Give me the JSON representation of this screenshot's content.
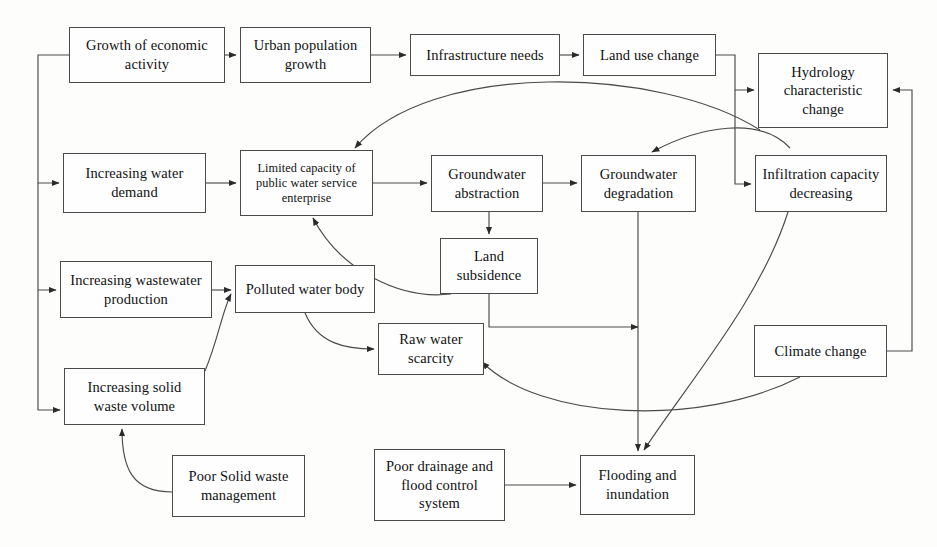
{
  "diagram": {
    "stroke_color": "#4a4a4a",
    "text_color": "#111111",
    "background": "#fdfdfc",
    "nodes": [
      {
        "id": "growth_economic",
        "label": "Growth of economic\nactivity",
        "x": 69,
        "y": 27,
        "w": 156,
        "h": 56,
        "small": false
      },
      {
        "id": "urban_population",
        "label": "Urban population\ngrowth",
        "x": 240,
        "y": 27,
        "w": 131,
        "h": 56,
        "small": false
      },
      {
        "id": "infrastructure_needs",
        "label": "Infrastructure needs",
        "x": 410,
        "y": 34,
        "w": 150,
        "h": 42,
        "small": false
      },
      {
        "id": "land_use_change",
        "label": "Land use change",
        "x": 583,
        "y": 34,
        "w": 133,
        "h": 42,
        "small": false
      },
      {
        "id": "hydrology_change",
        "label": "Hydrology\ncharacteristic\nchange",
        "x": 758,
        "y": 53,
        "w": 130,
        "h": 75,
        "small": false
      },
      {
        "id": "increasing_water_demand",
        "label": "Increasing water\ndemand",
        "x": 63,
        "y": 153,
        "w": 143,
        "h": 60,
        "small": false
      },
      {
        "id": "limited_capacity",
        "label": "Limited capacity of\npublic water service\nenterprise",
        "x": 240,
        "y": 150,
        "w": 133,
        "h": 66,
        "small": true
      },
      {
        "id": "groundwater_abstraction",
        "label": "Groundwater\nabstraction",
        "x": 431,
        "y": 155,
        "w": 112,
        "h": 57,
        "small": false
      },
      {
        "id": "groundwater_degradation",
        "label": "Groundwater\ndegradation",
        "x": 581,
        "y": 155,
        "w": 115,
        "h": 57,
        "small": false
      },
      {
        "id": "infiltration_decreasing",
        "label": "Infiltration capacity\ndecreasing",
        "x": 755,
        "y": 155,
        "w": 132,
        "h": 57,
        "small": false
      },
      {
        "id": "increasing_wastewater",
        "label": "Increasing wastewater\nproduction",
        "x": 60,
        "y": 261,
        "w": 152,
        "h": 57,
        "small": false
      },
      {
        "id": "polluted_water_body",
        "label": "Polluted water body",
        "x": 235,
        "y": 265,
        "w": 140,
        "h": 48,
        "small": false
      },
      {
        "id": "land_subsidence",
        "label": "Land\nsubsidence",
        "x": 440,
        "y": 238,
        "w": 98,
        "h": 56,
        "small": false
      },
      {
        "id": "raw_water_scarcity",
        "label": "Raw water\nscarcity",
        "x": 378,
        "y": 323,
        "w": 106,
        "h": 52,
        "small": false
      },
      {
        "id": "climate_change",
        "label": "Climate change",
        "x": 754,
        "y": 325,
        "w": 133,
        "h": 52,
        "small": false
      },
      {
        "id": "increasing_solid_waste",
        "label": "Increasing solid\nwaste volume",
        "x": 64,
        "y": 368,
        "w": 141,
        "h": 57,
        "small": false
      },
      {
        "id": "poor_solid_waste_mgmt",
        "label": "Poor Solid waste\nmanagement",
        "x": 172,
        "y": 455,
        "w": 133,
        "h": 62,
        "small": false
      },
      {
        "id": "poor_drainage",
        "label": "Poor drainage and\nflood control\nsystem",
        "x": 374,
        "y": 449,
        "w": 131,
        "h": 72,
        "small": false
      },
      {
        "id": "flooding_inundation",
        "label": "Flooding and\ninundation",
        "x": 580,
        "y": 455,
        "w": 115,
        "h": 60,
        "small": false
      }
    ],
    "edges": [
      {
        "from": "growth_economic",
        "to": "urban_population",
        "kind": "straight"
      },
      {
        "from": "urban_population",
        "to": "infrastructure_needs",
        "kind": "straight"
      },
      {
        "from": "infrastructure_needs",
        "to": "land_use_change",
        "kind": "straight"
      },
      {
        "from": "land_use_change",
        "to": "hydrology_change",
        "kind": "orthogonal"
      },
      {
        "from": "land_use_change",
        "to": "infiltration_decreasing",
        "kind": "orthogonal"
      },
      {
        "from": "growth_economic",
        "to": "increasing_water_demand",
        "kind": "orthogonal"
      },
      {
        "from": "growth_economic",
        "to": "increasing_wastewater",
        "kind": "orthogonal"
      },
      {
        "from": "growth_economic",
        "to": "increasing_solid_waste",
        "kind": "orthogonal"
      },
      {
        "from": "increasing_water_demand",
        "to": "limited_capacity",
        "kind": "straight"
      },
      {
        "from": "limited_capacity",
        "to": "groundwater_abstraction",
        "kind": "straight"
      },
      {
        "from": "groundwater_abstraction",
        "to": "groundwater_degradation",
        "kind": "straight"
      },
      {
        "from": "groundwater_abstraction",
        "to": "land_subsidence",
        "kind": "straight"
      },
      {
        "from": "increasing_wastewater",
        "to": "polluted_water_body",
        "kind": "straight"
      },
      {
        "from": "polluted_water_body",
        "to": "raw_water_scarcity",
        "kind": "curve"
      },
      {
        "from": "increasing_solid_waste",
        "to": "polluted_water_body",
        "kind": "curve"
      },
      {
        "from": "poor_solid_waste_mgmt",
        "to": "increasing_solid_waste",
        "kind": "curve"
      },
      {
        "from": "poor_drainage",
        "to": "flooding_inundation",
        "kind": "straight"
      },
      {
        "from": "groundwater_degradation",
        "to": "flooding_inundation",
        "kind": "straight"
      },
      {
        "from": "land_subsidence",
        "to": "flooding_inundation",
        "kind": "orthogonal"
      },
      {
        "from": "infiltration_decreasing",
        "to": "flooding_inundation",
        "kind": "curve"
      },
      {
        "from": "hydrology_change",
        "to": "limited_capacity",
        "kind": "curve"
      },
      {
        "from": "infiltration_decreasing",
        "to": "groundwater_degradation",
        "kind": "curve"
      },
      {
        "from": "climate_change",
        "to": "hydrology_change",
        "kind": "orthogonal"
      },
      {
        "from": "climate_change",
        "to": "raw_water_scarcity",
        "kind": "curve"
      },
      {
        "from": "land_subsidence",
        "to": "limited_capacity",
        "kind": "curve"
      }
    ]
  }
}
